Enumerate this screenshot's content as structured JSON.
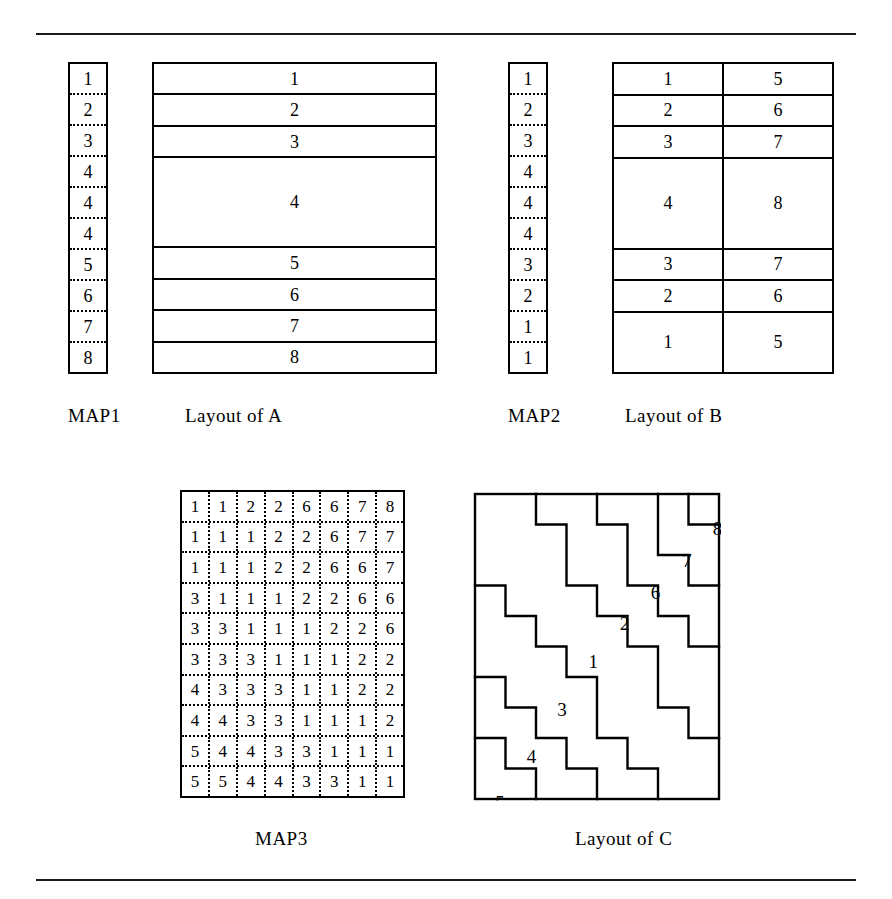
{
  "figure": {
    "rules": {
      "top": "horizontal-rule",
      "bottom": "horizontal-rule"
    }
  },
  "map1": {
    "caption": "MAP1",
    "cells": [
      "1",
      "2",
      "3",
      "4",
      "4",
      "4",
      "5",
      "6",
      "7",
      "8"
    ]
  },
  "layout_a": {
    "caption": "Layout of A",
    "rows": [
      {
        "cells": [
          "1"
        ],
        "span": 1
      },
      {
        "cells": [
          "2"
        ],
        "span": 1
      },
      {
        "cells": [
          "3"
        ],
        "span": 1
      },
      {
        "cells": [
          "4"
        ],
        "span": 3
      },
      {
        "cells": [
          "5"
        ],
        "span": 1
      },
      {
        "cells": [
          "6"
        ],
        "span": 1
      },
      {
        "cells": [
          "7"
        ],
        "span": 1
      },
      {
        "cells": [
          "8"
        ],
        "span": 1
      }
    ]
  },
  "map2": {
    "caption": "MAP2",
    "cells": [
      "1",
      "2",
      "3",
      "4",
      "4",
      "4",
      "3",
      "2",
      "1",
      "1"
    ]
  },
  "layout_b": {
    "caption": "Layout of B",
    "rows": [
      {
        "cells": [
          "1",
          "5"
        ],
        "span": 1
      },
      {
        "cells": [
          "2",
          "6"
        ],
        "span": 1
      },
      {
        "cells": [
          "3",
          "7"
        ],
        "span": 1
      },
      {
        "cells": [
          "4",
          "8"
        ],
        "span": 3
      },
      {
        "cells": [
          "3",
          "7"
        ],
        "span": 1
      },
      {
        "cells": [
          "2",
          "6"
        ],
        "span": 1
      },
      {
        "cells": [
          "1",
          "5"
        ],
        "span": 2
      }
    ]
  },
  "map3": {
    "caption": "MAP3",
    "rows": [
      [
        "1",
        "1",
        "2",
        "2",
        "6",
        "6",
        "7",
        "8"
      ],
      [
        "1",
        "1",
        "1",
        "2",
        "2",
        "6",
        "7",
        "7"
      ],
      [
        "1",
        "1",
        "1",
        "2",
        "2",
        "6",
        "6",
        "7"
      ],
      [
        "3",
        "1",
        "1",
        "1",
        "2",
        "2",
        "6",
        "6"
      ],
      [
        "3",
        "3",
        "1",
        "1",
        "1",
        "2",
        "2",
        "6"
      ],
      [
        "3",
        "3",
        "3",
        "1",
        "1",
        "1",
        "2",
        "2"
      ],
      [
        "4",
        "3",
        "3",
        "3",
        "1",
        "1",
        "2",
        "2"
      ],
      [
        "4",
        "4",
        "3",
        "3",
        "1",
        "1",
        "1",
        "2"
      ],
      [
        "5",
        "4",
        "4",
        "3",
        "3",
        "1",
        "1",
        "1"
      ],
      [
        "5",
        "5",
        "4",
        "4",
        "3",
        "3",
        "1",
        "1"
      ]
    ]
  },
  "layout_c": {
    "caption": "Layout of C",
    "labels": [
      {
        "text": "8",
        "x": 7.45,
        "y": 0.62
      },
      {
        "text": "7",
        "x": 6.45,
        "y": 1.68
      },
      {
        "text": "6",
        "x": 5.42,
        "y": 2.72
      },
      {
        "text": "2",
        "x": 4.4,
        "y": 3.76
      },
      {
        "text": "1",
        "x": 3.38,
        "y": 5.0
      },
      {
        "text": "3",
        "x": 2.35,
        "y": 6.55
      },
      {
        "text": "4",
        "x": 1.35,
        "y": 8.1
      },
      {
        "text": "5",
        "x": 0.32,
        "y": 9.62
      }
    ],
    "cols": 8,
    "rows": 10
  }
}
